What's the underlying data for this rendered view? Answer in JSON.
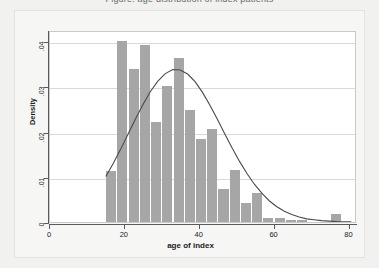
{
  "title_fragment": "Figure: age distribution of index patients",
  "colors": {
    "page_background": "#f1f1f0",
    "figure_background": "#f6f6f5",
    "plot_background": "#ffffff",
    "bar_fill": "#a6a6a6",
    "curve": "#4a4a4a",
    "gridline": "#d9d9d9",
    "axis": "#5a5a5a",
    "text": "#1b1b1b"
  },
  "chart_data": {
    "type": "bar",
    "title": "",
    "xlabel": "age of index",
    "ylabel": "Density",
    "xlim": [
      0,
      82
    ],
    "ylim": [
      0,
      0.0425
    ],
    "xticks": [
      0,
      20,
      40,
      60,
      80
    ],
    "xticklabels": [
      "0",
      "20",
      "40",
      "60",
      "80"
    ],
    "yticks": [
      0,
      0.01,
      0.02,
      0.03,
      0.04
    ],
    "yticklabels": [
      "0",
      ".01",
      ".02",
      ".03",
      ".04"
    ],
    "grid": "horizontal",
    "legend": "none",
    "bin_width": 3,
    "bin_starts": [
      15,
      18,
      21,
      24,
      27,
      30,
      33,
      36,
      39,
      42,
      45,
      48,
      51,
      54,
      57,
      60,
      63,
      66,
      69,
      72,
      75,
      78
    ],
    "bin_centers": [
      16.5,
      19.5,
      22.5,
      25.5,
      28.5,
      31.5,
      34.5,
      37.5,
      40.5,
      43.5,
      46.5,
      49.5,
      52.5,
      55.5,
      58.5,
      61.5,
      64.5,
      67.5,
      70.5,
      73.5,
      76.5,
      79.5
    ],
    "values": [
      0.0113,
      0.0401,
      0.0338,
      0.0392,
      0.0221,
      0.0301,
      0.0362,
      0.0249,
      0.0184,
      0.0206,
      0.0073,
      0.0116,
      0.0042,
      0.0064,
      0.0008,
      0.0008,
      0.0004,
      0.0004,
      0.0,
      0.0,
      0.0018,
      0.0
    ],
    "overlay_curve": {
      "name": "normal density",
      "type": "line",
      "mean": 33.0,
      "peak_value": 0.0341,
      "x": [
        15,
        17,
        19,
        21,
        23,
        25,
        27,
        29,
        31,
        33,
        35,
        37,
        39,
        41,
        43,
        45,
        47,
        49,
        51,
        53,
        55,
        57,
        59,
        61,
        63,
        65,
        67,
        69,
        71,
        73,
        75,
        77,
        79,
        81
      ],
      "y": [
        0.0102,
        0.0131,
        0.0163,
        0.0197,
        0.0231,
        0.0263,
        0.0292,
        0.0315,
        0.0332,
        0.0341,
        0.034,
        0.0331,
        0.0314,
        0.029,
        0.0261,
        0.023,
        0.0197,
        0.0165,
        0.0135,
        0.0108,
        0.0084,
        0.0064,
        0.0047,
        0.0034,
        0.0024,
        0.0017,
        0.0011,
        0.0007,
        0.0005,
        0.0003,
        0.0002,
        0.0001,
        5e-05,
        2e-05
      ]
    }
  }
}
